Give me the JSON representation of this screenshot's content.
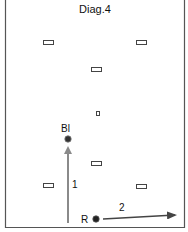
{
  "diagram": {
    "title": "Diag.4",
    "colors": {
      "border": "#555555",
      "arrow": "#8a8a8a",
      "arrow_dark": "#444444",
      "marker_stroke": "#444444",
      "ball": "#333333",
      "text": "#111111"
    },
    "markers": [
      {
        "name": "marker-top-left",
        "x": 43,
        "y": 40,
        "w": 10,
        "h": 4
      },
      {
        "name": "marker-top-right",
        "x": 136,
        "y": 40,
        "w": 10,
        "h": 4
      },
      {
        "name": "marker-upper-center",
        "x": 91,
        "y": 67,
        "w": 10,
        "h": 4
      },
      {
        "name": "marker-center-small",
        "x": 96,
        "y": 111,
        "w": 3,
        "h": 4
      },
      {
        "name": "marker-lower-center",
        "x": 91,
        "y": 161,
        "w": 10,
        "h": 4
      },
      {
        "name": "marker-bottom-left",
        "x": 43,
        "y": 183,
        "w": 10,
        "h": 4
      },
      {
        "name": "marker-bottom-right",
        "x": 136,
        "y": 184,
        "w": 10,
        "h": 4
      }
    ],
    "players": [
      {
        "label": "Bl",
        "x": 68,
        "y": 139,
        "label_x": 61,
        "label_y": 132
      },
      {
        "label": "R",
        "x": 96,
        "y": 219,
        "label_x": 81,
        "label_y": 223
      }
    ],
    "arrows": [
      {
        "label": "1",
        "x1": 68,
        "y1": 223,
        "x2": 68,
        "y2": 146,
        "label_x": 72,
        "label_y": 188
      },
      {
        "label": "2",
        "x1": 103,
        "y1": 219,
        "x2": 177,
        "y2": 215,
        "label_x": 119,
        "label_y": 211
      }
    ]
  }
}
